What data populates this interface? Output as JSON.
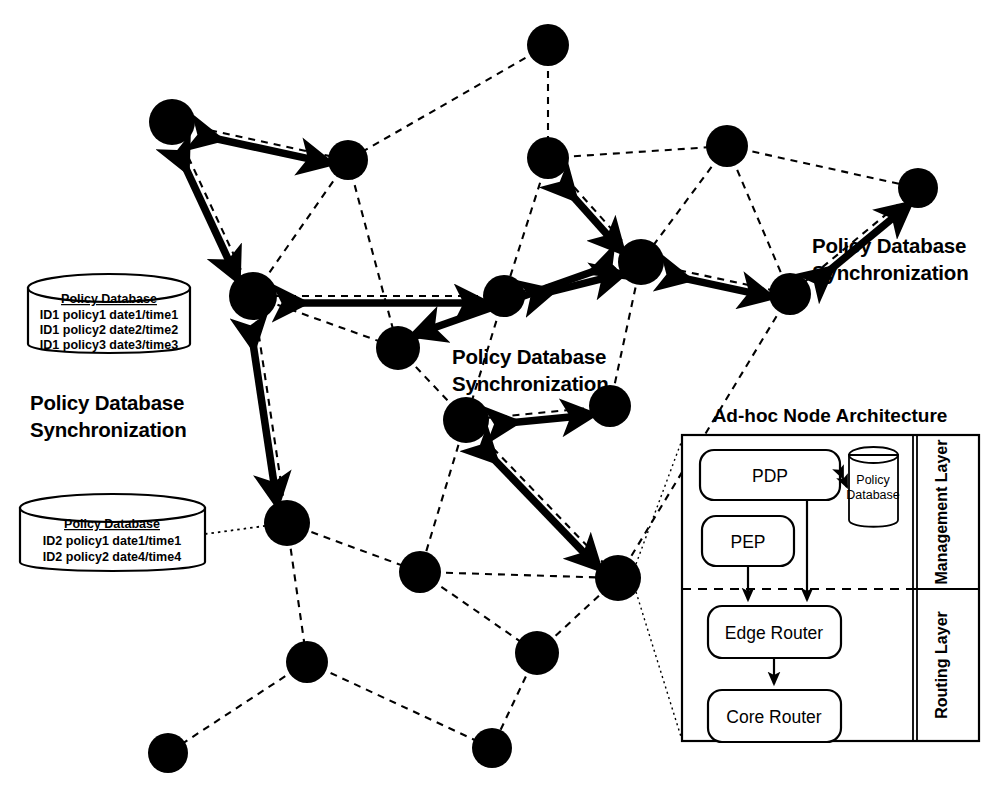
{
  "figure": {
    "type": "network-architecture-diagram",
    "background": "#ffffff",
    "ink": "#000000"
  },
  "sync_labels": [
    {
      "id": "sync-left",
      "line1": "Policy Database",
      "line2": "Synchronization",
      "x": 30,
      "y": 400
    },
    {
      "id": "sync-center",
      "line1": "Policy Database",
      "line2": "Synchronization",
      "x": 452,
      "y": 354
    },
    {
      "id": "sync-right",
      "line1": "Policy Database",
      "line2": "Synchronization",
      "x": 812,
      "y": 243
    }
  ],
  "databases": [
    {
      "id": "policy-db-1",
      "title": "Policy Database",
      "rows": [
        "ID1 policy1 date1/time1",
        "ID1 policy2 date2/time2",
        "ID1 policy3 date3/time3"
      ],
      "x": 28,
      "y": 272,
      "w": 162,
      "h": 88
    },
    {
      "id": "policy-db-2",
      "title": "Policy Database",
      "rows": [
        "ID2 policy1 date1/time1",
        "ID2 policy2 date4/time4"
      ],
      "x": 20,
      "y": 492,
      "w": 185,
      "h": 86
    }
  ],
  "architecture": {
    "title": "Ad-hoc Node Architecture",
    "layers": [
      {
        "id": "management-layer",
        "label": "Management Layer"
      },
      {
        "id": "routing-layer",
        "label": "Routing Layer"
      }
    ],
    "boxes": [
      {
        "id": "pdp",
        "label": "PDP"
      },
      {
        "id": "pep",
        "label": "PEP"
      },
      {
        "id": "edge-router",
        "label": "Edge Router"
      },
      {
        "id": "core-router",
        "label": "Core Router"
      }
    ],
    "policy_database": {
      "id": "arch-policy-db",
      "line1": "Policy",
      "line2": "Database"
    }
  },
  "chart_data": {
    "type": "scatter",
    "nodes": [
      {
        "id": "n1",
        "x": 548,
        "y": 45,
        "r": 21
      },
      {
        "id": "n2",
        "x": 172,
        "y": 122,
        "r": 23
      },
      {
        "id": "n3",
        "x": 348,
        "y": 160,
        "r": 20
      },
      {
        "id": "n4",
        "x": 548,
        "y": 158,
        "r": 21
      },
      {
        "id": "n5",
        "x": 727,
        "y": 146,
        "r": 21
      },
      {
        "id": "n6",
        "x": 918,
        "y": 188,
        "r": 20
      },
      {
        "id": "n7",
        "x": 641,
        "y": 262,
        "r": 23
      },
      {
        "id": "n8",
        "x": 504,
        "y": 296,
        "r": 21
      },
      {
        "id": "n9",
        "x": 790,
        "y": 294,
        "r": 21
      },
      {
        "id": "n10",
        "x": 253,
        "y": 296,
        "r": 24
      },
      {
        "id": "n11",
        "x": 398,
        "y": 348,
        "r": 22
      },
      {
        "id": "n12",
        "x": 610,
        "y": 406,
        "r": 21
      },
      {
        "id": "n13",
        "x": 466,
        "y": 420,
        "r": 23
      },
      {
        "id": "n14",
        "x": 287,
        "y": 523,
        "r": 23
      },
      {
        "id": "n15",
        "x": 420,
        "y": 572,
        "r": 21
      },
      {
        "id": "n16",
        "x": 618,
        "y": 578,
        "r": 23
      },
      {
        "id": "n17",
        "x": 537,
        "y": 653,
        "r": 22
      },
      {
        "id": "n18",
        "x": 307,
        "y": 662,
        "r": 21
      },
      {
        "id": "n19",
        "x": 168,
        "y": 753,
        "r": 20
      },
      {
        "id": "n20",
        "x": 492,
        "y": 748,
        "r": 20
      }
    ],
    "dashed_links": [
      [
        "n2",
        "n3"
      ],
      [
        "n2",
        "n10"
      ],
      [
        "n3",
        "n10"
      ],
      [
        "n3",
        "n11"
      ],
      [
        "n1",
        "n3"
      ],
      [
        "n1",
        "n4"
      ],
      [
        "n4",
        "n8"
      ],
      [
        "n4",
        "n7"
      ],
      [
        "n4",
        "n5"
      ],
      [
        "n5",
        "n6"
      ],
      [
        "n5",
        "n7"
      ],
      [
        "n5",
        "n9"
      ],
      [
        "n6",
        "n9"
      ],
      [
        "n7",
        "n8"
      ],
      [
        "n7",
        "n9"
      ],
      [
        "n7",
        "n12"
      ],
      [
        "n8",
        "n10"
      ],
      [
        "n8",
        "n11"
      ],
      [
        "n8",
        "n13"
      ],
      [
        "n9",
        "n16"
      ],
      [
        "n10",
        "n11"
      ],
      [
        "n10",
        "n14"
      ],
      [
        "n11",
        "n13"
      ],
      [
        "n12",
        "n13"
      ],
      [
        "n13",
        "n15"
      ],
      [
        "n13",
        "n16"
      ],
      [
        "n14",
        "n15"
      ],
      [
        "n14",
        "n18"
      ],
      [
        "n15",
        "n16"
      ],
      [
        "n15",
        "n17"
      ],
      [
        "n16",
        "n17"
      ],
      [
        "n17",
        "n20"
      ],
      [
        "n18",
        "n19"
      ],
      [
        "n18",
        "n20"
      ]
    ],
    "sync_arrows": [
      [
        "n2",
        "n3"
      ],
      [
        "n2",
        "n10"
      ],
      [
        "n10",
        "n8"
      ],
      [
        "n10",
        "n14"
      ],
      [
        "n8",
        "n7"
      ],
      [
        "n7",
        "n11"
      ],
      [
        "n4",
        "n7"
      ],
      [
        "n7",
        "n9"
      ],
      [
        "n9",
        "n6"
      ],
      [
        "n13",
        "n12"
      ],
      [
        "n13",
        "n16"
      ]
    ],
    "dotted_links": [
      [
        "policy-db-2",
        "n14"
      ]
    ]
  }
}
